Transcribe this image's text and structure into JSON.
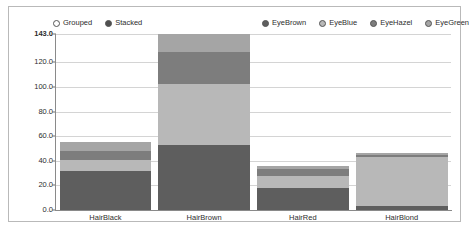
{
  "chart_data": {
    "type": "bar",
    "stacked": true,
    "title": "",
    "xlabel": "",
    "ylabel": "",
    "categories": [
      "HairBlack",
      "HairBrown",
      "HairRed",
      "HairBlond"
    ],
    "series": [
      {
        "name": "EyeBrown",
        "color": "#5e5e5e",
        "values": [
          32,
          53,
          18,
          3
        ]
      },
      {
        "name": "EyeBlue",
        "color": "#b8b8b8",
        "values": [
          9,
          49,
          10,
          40
        ]
      },
      {
        "name": "EyeHazel",
        "color": "#7d7d7d",
        "values": [
          7,
          26,
          5,
          2
        ]
      },
      {
        "name": "EyeGreen",
        "color": "#a5a5a5",
        "values": [
          7.5,
          15,
          3,
          1
        ]
      }
    ],
    "totals": [
      55.5,
      143,
      36,
      46
    ],
    "ylim": [
      0,
      143
    ],
    "yticks": [
      "143.0",
      "120.0",
      "100.0",
      "80.0",
      "60.0",
      "40.0",
      "20.0",
      "0.0"
    ],
    "ytick_values": [
      143.0,
      120.0,
      100.0,
      80.0,
      60.0,
      40.0,
      20.0,
      0.0
    ],
    "grid": true,
    "legend_position": "top"
  },
  "mode_legend": {
    "items": [
      {
        "label": "Grouped",
        "selected": false,
        "color": "#ffffff"
      },
      {
        "label": "Stacked",
        "selected": true,
        "color": "#4f4f4f"
      }
    ]
  },
  "series_legend": {
    "items": [
      {
        "label": "EyeBrown",
        "color": "#5e5e5e"
      },
      {
        "label": "EyeBlue",
        "color": "#b8b8b8"
      },
      {
        "label": "EyeHazel",
        "color": "#7d7d7d"
      },
      {
        "label": "EyeGreen",
        "color": "#a5a5a5"
      }
    ]
  }
}
